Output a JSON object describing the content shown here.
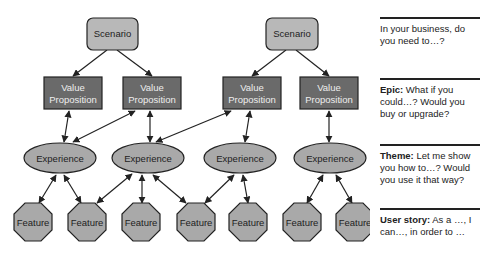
{
  "colors": {
    "scenario_fill": "#b8b8b8",
    "value_prop_fill": "#6a6a6a",
    "value_prop_text": "#eeeeee",
    "experience_fill": "#a9a9a9",
    "feature_fill": "#a9a9a9",
    "stroke": "#222222",
    "background": "#ffffff"
  },
  "diagram": {
    "scenarios": [
      {
        "label": "Scenario"
      },
      {
        "label": "Scenario"
      }
    ],
    "value_propositions": [
      {
        "line1": "Value",
        "line2": "Proposition"
      },
      {
        "line1": "Value",
        "line2": "Proposition"
      },
      {
        "line1": "Value",
        "line2": "Proposition"
      },
      {
        "line1": "Value",
        "line2": "Proposition"
      }
    ],
    "experiences": [
      {
        "label": "Experience"
      },
      {
        "label": "Experience"
      },
      {
        "label": "Experience"
      },
      {
        "label": "Experience"
      }
    ],
    "features": [
      {
        "label": "Feature"
      },
      {
        "label": "Feature"
      },
      {
        "label": "Feature"
      },
      {
        "label": "Feature"
      },
      {
        "label": "Feature"
      },
      {
        "label": "Feature"
      },
      {
        "label": "Feature"
      }
    ]
  },
  "legend": [
    {
      "bold": "",
      "text": "In your business, do you need to…?"
    },
    {
      "bold": "Epic:",
      "text": " What if you could…? Would you buy or upgrade?"
    },
    {
      "bold": "Theme:",
      "text": " Let me show you how to…? Would you use it that way?"
    },
    {
      "bold": "User story:",
      "text": " As a …, I can…, in order to …"
    }
  ]
}
